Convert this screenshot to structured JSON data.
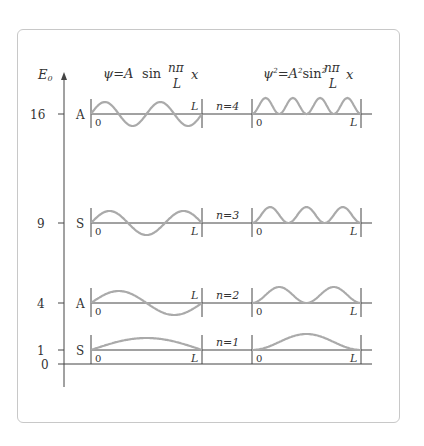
{
  "diagram": {
    "axis_label": "E",
    "axis_label_sub": "0",
    "header_left": {
      "psi": "ψ",
      "eq": "=",
      "A": "A",
      "sin": "sin",
      "num": "nπ",
      "den": "L",
      "x": "x"
    },
    "header_right": {
      "psi": "ψ",
      "sup": "2",
      "eq": "=",
      "A": "A",
      "sup2": "2",
      "sin": "sin",
      "sup3": "2",
      "num": "nπ",
      "den": "L",
      "x": "x"
    },
    "zero_label": "0",
    "panel_zero": "0",
    "panel_L": "L",
    "colors": {
      "curve": "#aaaaaa",
      "line": "#444444",
      "frame": "#c8c8c8"
    },
    "levels": [
      {
        "n": 4,
        "n_label": "n=4",
        "energy_label": "16",
        "parity": "A",
        "y": 114
      },
      {
        "n": 3,
        "n_label": "n=3",
        "energy_label": "9",
        "parity": "S",
        "y": 223
      },
      {
        "n": 2,
        "n_label": "n=2",
        "energy_label": "4",
        "parity": "A",
        "y": 303
      },
      {
        "n": 1,
        "n_label": "n=1",
        "energy_label": "1",
        "parity": "S",
        "y": 350
      }
    ]
  }
}
